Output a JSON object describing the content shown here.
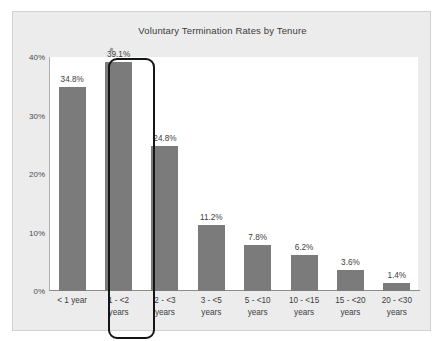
{
  "chart_data": {
    "type": "bar",
    "title": "Voluntary Termination Rates by Tenure",
    "xlabel": "",
    "ylabel": "",
    "ylim": [
      0,
      40
    ],
    "grid": false,
    "legend": null,
    "categories": [
      "< 1 year",
      "1 - <2 years",
      "2 - <3 years",
      "3 - <5 years",
      "5 - <10 years",
      "10 - <15 years",
      "15 - <20 years",
      "20 - <30 years"
    ],
    "category_lines": [
      [
        "< 1 year"
      ],
      [
        "1 - <2",
        "years"
      ],
      [
        "2 - <3",
        "years"
      ],
      [
        "3 - <5",
        "years"
      ],
      [
        "5 - <10",
        "years"
      ],
      [
        "10 - <15",
        "years"
      ],
      [
        "15 - <20",
        "years"
      ],
      [
        "20 - <30",
        "years"
      ]
    ],
    "values": [
      34.8,
      39.1,
      24.8,
      11.2,
      7.8,
      6.2,
      3.6,
      1.4
    ],
    "value_labels": [
      "34.8%",
      "39.1%",
      "24.8%",
      "11.2%",
      "7.8%",
      "6.2%",
      "3.6%",
      "1.4%"
    ],
    "y_ticks": [
      0,
      10,
      20,
      30,
      40
    ],
    "y_tick_labels": [
      "0%",
      "10%",
      "20%",
      "30%",
      "40%"
    ],
    "bar_color": "#7b7b7b",
    "panel_color": "#ececed",
    "plot_color": "#ffffff",
    "highlight": {
      "category": "1 - <2 years",
      "index": 1,
      "color": "#151515"
    }
  }
}
